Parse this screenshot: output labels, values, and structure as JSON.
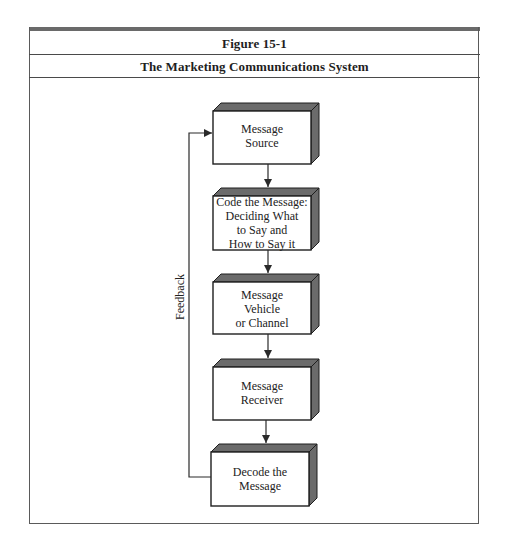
{
  "figure": {
    "number": "Figure 15-1",
    "title": "The Marketing Communications System"
  },
  "diagram": {
    "boxes": [
      {
        "id": "message-source",
        "label_lines": [
          "Message",
          "Source"
        ]
      },
      {
        "id": "code-message",
        "label_lines": [
          "Code the Message:",
          "Deciding What",
          "to Say and",
          "How to Say it"
        ]
      },
      {
        "id": "message-vehicle",
        "label_lines": [
          "Message",
          "Vehicle",
          "or Channel"
        ]
      },
      {
        "id": "message-receiver",
        "label_lines": [
          "Message",
          "Receiver"
        ]
      },
      {
        "id": "decode-message",
        "label_lines": [
          "Decode the",
          "Message"
        ]
      }
    ],
    "feedback_label": "Feedback",
    "colors": {
      "box_fill": "#ffffff",
      "box_stroke": "#1e1e1e",
      "box_depth": "#6b6b6b",
      "line": "#2a2a2a"
    }
  }
}
